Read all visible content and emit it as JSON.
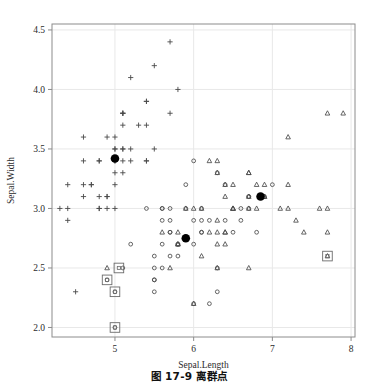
{
  "figure": {
    "caption_number": "图 17-9",
    "caption_text": "离群点",
    "caption_full": "图 17-9    离群点"
  },
  "chart_data": {
    "type": "scatter",
    "title": "",
    "xlabel": "Sepal.Length",
    "ylabel": "Sepal.Width",
    "xlim": [
      4.2,
      8.05
    ],
    "ylim": [
      1.92,
      4.55
    ],
    "xticks": [
      5,
      6,
      7,
      8
    ],
    "xtick_labels": [
      "5",
      "6",
      "7",
      "8"
    ],
    "yticks": [
      2.0,
      2.5,
      3.0,
      3.5,
      4.0,
      4.5
    ],
    "ytick_labels": [
      "2.0",
      "2.5",
      "3.0",
      "3.5",
      "4.0",
      "4.5"
    ],
    "grid": true,
    "grid_color": "#e8e8e8",
    "frame_color": "#8c8c8c",
    "legend": null,
    "legend_position": "none",
    "marker_color": "#4a4a4a",
    "center_color": "#000000",
    "outlier_box_color": "#6b6b6b",
    "series": [
      {
        "name": "cluster-1",
        "marker": "plus",
        "points": [
          [
            5.1,
            3.5
          ],
          [
            4.9,
            3.0
          ],
          [
            4.7,
            3.2
          ],
          [
            4.6,
            3.1
          ],
          [
            5.0,
            3.6
          ],
          [
            5.4,
            3.9
          ],
          [
            4.6,
            3.4
          ],
          [
            5.0,
            3.4
          ],
          [
            4.4,
            2.9
          ],
          [
            4.9,
            3.1
          ],
          [
            5.4,
            3.7
          ],
          [
            4.8,
            3.4
          ],
          [
            4.8,
            3.0
          ],
          [
            4.3,
            3.0
          ],
          [
            5.8,
            4.0
          ],
          [
            5.7,
            4.4
          ],
          [
            5.4,
            3.9
          ],
          [
            5.1,
            3.5
          ],
          [
            5.7,
            3.8
          ],
          [
            5.1,
            3.8
          ],
          [
            5.4,
            3.4
          ],
          [
            5.1,
            3.7
          ],
          [
            4.6,
            3.6
          ],
          [
            5.1,
            3.3
          ],
          [
            4.8,
            3.4
          ],
          [
            5.0,
            3.0
          ],
          [
            5.0,
            3.4
          ],
          [
            5.2,
            3.5
          ],
          [
            5.2,
            3.4
          ],
          [
            4.7,
            3.2
          ],
          [
            4.8,
            3.1
          ],
          [
            5.4,
            3.4
          ],
          [
            5.2,
            4.1
          ],
          [
            5.5,
            4.2
          ],
          [
            4.9,
            3.1
          ],
          [
            5.0,
            3.2
          ],
          [
            5.5,
            3.5
          ],
          [
            4.9,
            3.6
          ],
          [
            4.4,
            3.0
          ],
          [
            5.1,
            3.4
          ],
          [
            5.0,
            3.5
          ],
          [
            4.5,
            2.3
          ],
          [
            4.4,
            3.2
          ],
          [
            5.0,
            3.5
          ],
          [
            5.1,
            3.8
          ],
          [
            4.8,
            3.0
          ],
          [
            5.1,
            3.8
          ],
          [
            4.6,
            3.2
          ],
          [
            5.3,
            3.7
          ],
          [
            5.0,
            3.3
          ]
        ]
      },
      {
        "name": "cluster-2",
        "marker": "circle",
        "points": [
          [
            7.0,
            3.2
          ],
          [
            6.4,
            3.2
          ],
          [
            6.9,
            3.1
          ],
          [
            5.5,
            2.3
          ],
          [
            6.5,
            2.8
          ],
          [
            5.7,
            2.8
          ],
          [
            6.3,
            3.3
          ],
          [
            4.9,
            2.4
          ],
          [
            6.6,
            2.9
          ],
          [
            5.2,
            2.7
          ],
          [
            5.0,
            2.0
          ],
          [
            5.9,
            3.0
          ],
          [
            6.0,
            2.2
          ],
          [
            6.1,
            2.9
          ],
          [
            5.6,
            2.9
          ],
          [
            6.7,
            3.1
          ],
          [
            5.6,
            3.0
          ],
          [
            5.8,
            2.7
          ],
          [
            6.2,
            2.2
          ],
          [
            5.6,
            2.5
          ],
          [
            5.9,
            3.2
          ],
          [
            6.1,
            2.8
          ],
          [
            6.3,
            2.5
          ],
          [
            6.1,
            2.8
          ],
          [
            6.4,
            2.9
          ],
          [
            6.6,
            3.0
          ],
          [
            6.8,
            2.8
          ],
          [
            6.7,
            3.0
          ],
          [
            6.0,
            2.9
          ],
          [
            5.7,
            2.6
          ],
          [
            5.5,
            2.4
          ],
          [
            5.5,
            2.4
          ],
          [
            5.8,
            2.7
          ],
          [
            6.0,
            2.7
          ],
          [
            5.4,
            3.0
          ],
          [
            6.0,
            3.4
          ],
          [
            6.7,
            3.1
          ],
          [
            6.3,
            2.3
          ],
          [
            5.6,
            3.0
          ],
          [
            5.5,
            2.5
          ],
          [
            5.5,
            2.6
          ],
          [
            6.1,
            3.0
          ],
          [
            5.8,
            2.6
          ],
          [
            5.0,
            2.3
          ],
          [
            5.6,
            2.7
          ],
          [
            5.7,
            3.0
          ],
          [
            5.7,
            2.9
          ],
          [
            6.2,
            2.9
          ],
          [
            5.1,
            2.5
          ],
          [
            5.7,
            2.8
          ]
        ]
      },
      {
        "name": "cluster-3",
        "marker": "triangle",
        "points": [
          [
            6.3,
            3.3
          ],
          [
            5.8,
            2.7
          ],
          [
            7.1,
            3.0
          ],
          [
            6.3,
            2.9
          ],
          [
            6.5,
            3.0
          ],
          [
            7.6,
            3.0
          ],
          [
            4.9,
            2.5
          ],
          [
            7.3,
            2.9
          ],
          [
            6.7,
            2.5
          ],
          [
            7.2,
            3.6
          ],
          [
            6.5,
            3.2
          ],
          [
            6.4,
            2.7
          ],
          [
            6.8,
            3.0
          ],
          [
            5.7,
            2.5
          ],
          [
            5.8,
            2.8
          ],
          [
            6.4,
            3.2
          ],
          [
            6.5,
            3.0
          ],
          [
            7.7,
            3.8
          ],
          [
            7.7,
            2.6
          ],
          [
            6.0,
            2.2
          ],
          [
            6.9,
            3.2
          ],
          [
            5.6,
            2.8
          ],
          [
            7.7,
            2.8
          ],
          [
            6.3,
            2.7
          ],
          [
            6.7,
            3.3
          ],
          [
            7.2,
            3.2
          ],
          [
            6.2,
            2.8
          ],
          [
            6.1,
            3.0
          ],
          [
            6.4,
            2.8
          ],
          [
            7.2,
            3.0
          ],
          [
            7.4,
            2.8
          ],
          [
            7.9,
            3.8
          ],
          [
            6.4,
            2.8
          ],
          [
            6.3,
            2.8
          ],
          [
            6.1,
            2.6
          ],
          [
            7.7,
            3.0
          ],
          [
            6.3,
            3.4
          ],
          [
            6.4,
            3.1
          ],
          [
            6.0,
            3.0
          ],
          [
            6.9,
            3.1
          ],
          [
            6.7,
            3.1
          ],
          [
            6.9,
            3.1
          ],
          [
            5.8,
            2.7
          ],
          [
            6.8,
            3.2
          ],
          [
            6.7,
            3.3
          ],
          [
            6.7,
            3.0
          ],
          [
            6.3,
            2.5
          ],
          [
            6.5,
            3.0
          ],
          [
            6.2,
            3.4
          ],
          [
            5.9,
            3.0
          ]
        ]
      }
    ],
    "centers": {
      "name": "cluster-centers",
      "marker": "filled-circle",
      "points": [
        [
          5.0,
          3.42
        ],
        [
          5.9,
          2.75
        ],
        [
          6.85,
          3.1
        ]
      ]
    },
    "outliers": {
      "name": "outliers",
      "marker": "boxed",
      "points": [
        [
          5.05,
          2.5
        ],
        [
          4.9,
          2.4
        ],
        [
          5.0,
          2.3
        ],
        [
          5.0,
          2.0
        ],
        [
          7.7,
          2.6
        ]
      ]
    }
  }
}
